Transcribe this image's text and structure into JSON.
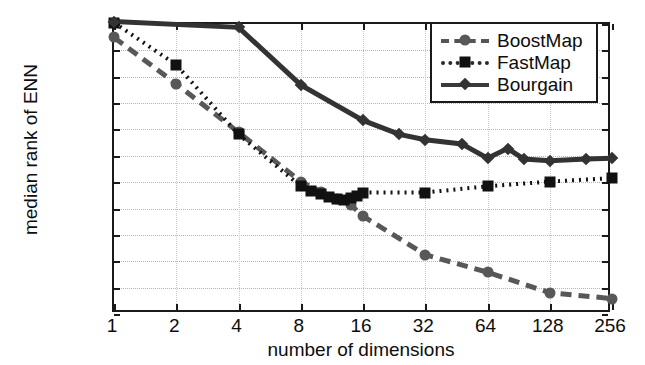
{
  "chart_data": {
    "type": "line",
    "title": "",
    "xlabel": "number of dimensions",
    "ylabel": "median rank of ENN",
    "xscale": "log2",
    "yscale": "log2",
    "xlim": [
      1,
      256
    ],
    "ylim": [
      8,
      16384
    ],
    "xticks": [
      1,
      2,
      4,
      8,
      16,
      32,
      64,
      128,
      256
    ],
    "xticklabels": [
      "1",
      "2",
      "4",
      "8",
      "16",
      "32",
      "64",
      "128",
      "256"
    ],
    "yticks": [
      8,
      16,
      32,
      64,
      128,
      256,
      512,
      1024,
      2048,
      4096,
      8192,
      16384
    ],
    "yticklabels": [
      "8",
      "16",
      "32",
      "64",
      "128",
      "256",
      "512",
      "1024",
      "2048",
      "4096",
      "8192",
      "16384"
    ],
    "grid": true,
    "legend_position": "top-right",
    "series": [
      {
        "name": "BoostMap",
        "marker": "circle",
        "linestyle": "dashed",
        "color": "#585858",
        "x": [
          1,
          2,
          4,
          8,
          10,
          12,
          14,
          16,
          32,
          64,
          128,
          256
        ],
        "y": [
          11500,
          3400,
          950,
          260,
          200,
          165,
          140,
          105,
          38,
          24,
          14,
          12
        ]
      },
      {
        "name": "FastMap",
        "marker": "square",
        "linestyle": "dotted",
        "color": "#111111",
        "x": [
          1,
          2,
          4,
          8,
          9,
          10,
          11,
          12,
          13,
          14,
          15,
          16,
          32,
          64,
          128,
          256
        ],
        "y": [
          17000,
          5600,
          900,
          230,
          205,
          190,
          175,
          165,
          162,
          168,
          180,
          195,
          195,
          230,
          260,
          285
        ]
      },
      {
        "name": "Bourgain",
        "marker": "diamond",
        "linestyle": "solid",
        "color": "#333333",
        "x": [
          1,
          4,
          8,
          16,
          24,
          32,
          48,
          64,
          80,
          96,
          128,
          192,
          256
        ],
        "y": [
          17500,
          15000,
          3300,
          1300,
          900,
          780,
          700,
          480,
          620,
          470,
          450,
          470,
          480
        ]
      }
    ]
  },
  "legend": {
    "items": [
      {
        "label": "BoostMap"
      },
      {
        "label": "FastMap"
      },
      {
        "label": "Bourgain"
      }
    ]
  },
  "axes": {
    "x_title": "number of dimensions",
    "y_title": "median rank of ENN"
  }
}
